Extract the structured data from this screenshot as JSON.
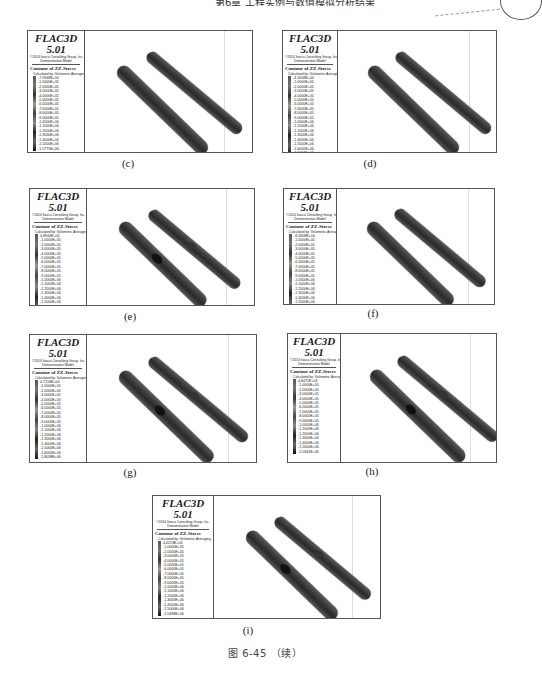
{
  "page_header": {
    "text": "第6章 工程实例与数值模拟分析结果"
  },
  "figure": {
    "title": "图 6-45  （续）"
  },
  "panels": [
    {
      "id": "c",
      "caption": "(c)",
      "legend": {
        "software": "FLAC3D 5.01",
        "copyright": "©2014 Itasca Consulting Group, Inc.",
        "model": "Demonstration Model",
        "contour_title": "Contour of ZZ-Stress",
        "calc_note": "Calculated by: Volumetric Averaging",
        "values": [
          "-7.0948E+04",
          "-1.0000E+05",
          "-2.0000E+05",
          "-3.0000E+05",
          "-4.0000E+05",
          "-5.0000E+05",
          "-6.0000E+05",
          "-7.0000E+05",
          "-8.0000E+05",
          "-9.0000E+05",
          "-1.0000E+06",
          "-1.1000E+06",
          "-1.2000E+06",
          "-1.3000E+06",
          "-1.4000E+06",
          "-1.5000E+06",
          "-1.5775E+06"
        ]
      },
      "has_holes": false
    },
    {
      "id": "d",
      "caption": "(d)",
      "legend": {
        "software": "FLAC3D 5.01",
        "copyright": "©2014 Itasca Consulting Group, Inc.",
        "model": "Demonstration Model",
        "contour_title": "Contour of ZZ-Stress",
        "calc_note": "Calculated by: Volumetric Averaging",
        "values": [
          "-4.3208E+04",
          "-1.0000E+05",
          "-2.0000E+05",
          "-3.0000E+05",
          "-4.0000E+05",
          "-5.0000E+05",
          "-6.0000E+05",
          "-7.0000E+05",
          "-8.0000E+05",
          "-9.0000E+05",
          "-1.0000E+06",
          "-1.1000E+06",
          "-1.2000E+06",
          "-1.3000E+06",
          "-1.4000E+06",
          "-1.5000E+06",
          "-1.6000E+06",
          "-1.6034E+06"
        ]
      },
      "has_holes": false
    },
    {
      "id": "e",
      "caption": "(e)",
      "legend": {
        "software": "FLAC3D 5.01",
        "copyright": "©2014 Itasca Consulting Group, Inc.",
        "model": "Demonstration Model",
        "contour_title": "Contour of ZZ-Stress",
        "calc_note": "Calculated by: Volumetric Averaging",
        "values": [
          "4.8944E+04",
          "-1.0000E+05",
          "-2.0000E+05",
          "-3.0000E+05",
          "-4.0000E+05",
          "-5.0000E+05",
          "-6.0000E+05",
          "-7.0000E+05",
          "-8.0000E+05",
          "-9.0000E+05",
          "-1.0000E+06",
          "-1.1000E+06",
          "-1.2000E+06",
          "-1.3000E+06",
          "-1.4000E+06",
          "-1.5000E+06",
          "-1.6000E+06",
          "-1.7000E+06",
          "-1.8083E+06"
        ]
      },
      "has_holes": true
    },
    {
      "id": "f",
      "caption": "(f)",
      "legend": {
        "software": "FLAC3D 5.01",
        "copyright": "©2014 Itasca Consulting Group, Inc.",
        "model": "Demonstration Model",
        "contour_title": "Contour of ZZ-Stress",
        "calc_note": "Calculated by: Volumetric Averaging",
        "values": [
          "-8.3008E+04",
          "-1.0000E+05",
          "-2.0000E+05",
          "-3.0000E+05",
          "-4.0000E+05",
          "-5.0000E+05",
          "-6.0000E+05",
          "-7.0000E+05",
          "-8.0000E+05",
          "-9.0000E+05",
          "-1.0000E+06",
          "-1.1000E+06",
          "-1.2000E+06",
          "-1.3000E+06",
          "-1.4000E+06",
          "-1.5000E+06",
          "-1.6000E+06",
          "-1.6173E+06"
        ]
      },
      "has_holes": false
    },
    {
      "id": "g",
      "caption": "(g)",
      "legend": {
        "software": "FLAC3D 5.01",
        "copyright": "©2014 Itasca Consulting Group, Inc.",
        "model": "Demonstration Model",
        "contour_title": "Contour of ZZ-Stress",
        "calc_note": "Calculated by: Volumetric Averaging",
        "values": [
          "4.7218E+04",
          "-1.0000E+05",
          "-2.0000E+05",
          "-3.0000E+05",
          "-4.0000E+05",
          "-5.0000E+05",
          "-6.0000E+05",
          "-7.0000E+05",
          "-8.0000E+05",
          "-9.0000E+05",
          "-1.0000E+06",
          "-1.1000E+06",
          "-1.2000E+06",
          "-1.3000E+06",
          "-1.4000E+06",
          "-1.5000E+06",
          "-1.6000E+06",
          "-1.8038E+06"
        ]
      },
      "has_holes": true
    },
    {
      "id": "h",
      "caption": "(h)",
      "legend": {
        "software": "FLAC3D 5.01",
        "copyright": "©2014 Itasca Consulting Group, Inc.",
        "model": "Demonstration Model",
        "contour_title": "Contour of ZZ-Stress",
        "calc_note": "Calculated by: Volumetric Averaging",
        "values": [
          "4.8472E+04",
          "-1.0000E+05",
          "-2.0000E+05",
          "-3.0000E+05",
          "-4.0000E+05",
          "-5.0000E+05",
          "-6.0000E+05",
          "-7.0000E+05",
          "-8.0000E+05",
          "-9.0000E+05",
          "-1.0000E+06",
          "-1.1000E+06",
          "-1.2000E+06",
          "-1.3000E+06",
          "-1.4000E+06",
          "-1.5000E+06",
          "-1.5841E+06"
        ]
      },
      "has_holes": true
    },
    {
      "id": "i",
      "caption": "(i)",
      "legend": {
        "software": "FLAC3D 5.01",
        "copyright": "©2014 Itasca Consulting Group, Inc.",
        "model": "Demonstration Model",
        "contour_title": "Contour of ZZ-Stress",
        "calc_note": "Calculated by: Volumetric Averaging",
        "values": [
          "4.0213E+04",
          "-1.0000E+05",
          "-2.0000E+05",
          "-3.0000E+05",
          "-4.0000E+05",
          "-5.0000E+05",
          "-6.0000E+05",
          "-7.0000E+05",
          "-8.0000E+05",
          "-9.0000E+05",
          "-1.0000E+06",
          "-1.1000E+06",
          "-1.2000E+06",
          "-1.3000E+06",
          "-1.4000E+06",
          "-1.5000E+06",
          "-1.5498E+06"
        ]
      },
      "has_holes": true
    }
  ]
}
